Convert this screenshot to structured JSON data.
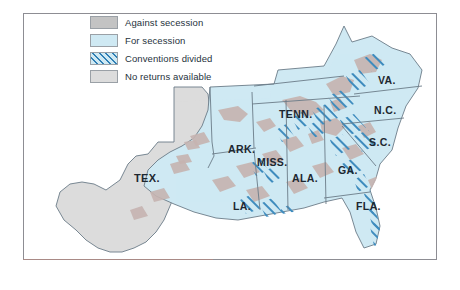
{
  "map": {
    "title": "Secession vote map of the Southern United States",
    "legend": {
      "items": [
        {
          "key": "against",
          "label": "Against secession",
          "color": "#c3c3c3"
        },
        {
          "key": "for",
          "label": "For secession",
          "color": "#cfe9f3"
        },
        {
          "key": "divided",
          "label": "Conventions divided",
          "color": "#2f7fb5"
        },
        {
          "key": "noreturn",
          "label": "No returns available",
          "color": "#dcdcdc"
        }
      ]
    },
    "states": [
      {
        "code": "TEX.",
        "label": "TEX.",
        "vote": "noreturn",
        "x": 110,
        "y": 168
      },
      {
        "code": "ARK.",
        "label": "ARK.",
        "vote": "for",
        "x": 204,
        "y": 139
      },
      {
        "code": "LA.",
        "label": "LA.",
        "vote": "for",
        "x": 209,
        "y": 196
      },
      {
        "code": "MISS.",
        "label": "MISS.",
        "vote": "for",
        "x": 247,
        "y": 149
      },
      {
        "code": "ALA.",
        "label": "ALA.",
        "vote": "for",
        "x": 280,
        "y": 165
      },
      {
        "code": "TENN.",
        "label": "TENN.",
        "vote": "for",
        "x": 274,
        "y": 111
      },
      {
        "code": "GA.",
        "label": "GA.",
        "vote": "for",
        "x": 323,
        "y": 159
      },
      {
        "code": "FLA.",
        "label": "FLA.",
        "vote": "divided",
        "x": 350,
        "y": 194
      },
      {
        "code": "S.C.",
        "label": "S.C.",
        "vote": "for",
        "x": 355,
        "y": 131
      },
      {
        "code": "N.C.",
        "label": "N.C.",
        "vote": "for",
        "x": 360,
        "y": 102
      },
      {
        "code": "VA.",
        "label": "VA.",
        "vote": "for",
        "x": 363,
        "y": 73
      }
    ],
    "colors": {
      "for_secession": "#cfe9f3",
      "against_secession": "#c6b4b1",
      "no_returns": "#dcdcdc",
      "divided_hatch": "#2f7fb5",
      "state_border": "#6b7c88",
      "frame": "#8d8d93",
      "background": "#ffffff"
    }
  }
}
